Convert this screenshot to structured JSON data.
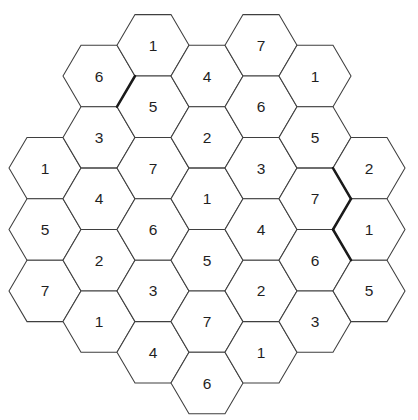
{
  "board": {
    "background_color": "#ffffff",
    "grid_line_color": "#3f3f3f",
    "thick_line_color": "#1a1a1a",
    "digit_color": "#1f1f1f",
    "columns": [
      {
        "col": 0,
        "start_k": 4,
        "values": [
          "1",
          "5",
          "7"
        ]
      },
      {
        "col": 1,
        "start_k": 1,
        "values": [
          "6",
          "3",
          "4",
          "2",
          "1"
        ]
      },
      {
        "col": 2,
        "start_k": 0,
        "values": [
          "1",
          "5",
          "7",
          "6",
          "3",
          "4"
        ]
      },
      {
        "col": 3,
        "start_k": 1,
        "values": [
          "4",
          "2",
          "1",
          "5",
          "7",
          "6"
        ]
      },
      {
        "col": 4,
        "start_k": 0,
        "values": [
          "7",
          "6",
          "3",
          "4",
          "2",
          "1"
        ]
      },
      {
        "col": 5,
        "start_k": 1,
        "values": [
          "1",
          "5",
          "7",
          "6",
          "3"
        ]
      },
      {
        "col": 6,
        "start_k": 4,
        "values": [
          "2",
          "1",
          "5"
        ]
      }
    ],
    "thick_edges": [
      {
        "x1": 135,
        "y1": 76.0,
        "x2": 117,
        "y2": 106.7
      },
      {
        "x1": 333,
        "y1": 168.1,
        "x2": 351,
        "y2": 198.8
      },
      {
        "x1": 351,
        "y1": 198.8,
        "x2": 333,
        "y2": 229.5
      },
      {
        "x1": 333,
        "y1": 229.5,
        "x2": 351,
        "y2": 260.2
      }
    ]
  }
}
